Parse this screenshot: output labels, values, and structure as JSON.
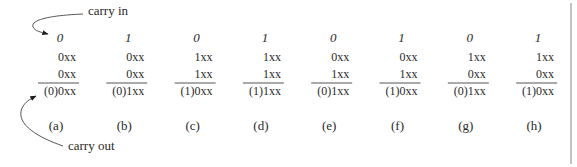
{
  "annotations": {
    "carry_in": "carry in",
    "carry_out": "carry out"
  },
  "columns": [
    {
      "label": "(a)",
      "carry_in": "0",
      "operand1": "0xx",
      "operand2": "0xx",
      "result": "(0)0xx"
    },
    {
      "label": "(b)",
      "carry_in": "1",
      "operand1": "0xx",
      "operand2": "0xx",
      "result": "(0)1xx"
    },
    {
      "label": "(c)",
      "carry_in": "0",
      "operand1": "1xx",
      "operand2": "1xx",
      "result": "(1)0xx"
    },
    {
      "label": "(d)",
      "carry_in": "1",
      "operand1": "1xx",
      "operand2": "1xx",
      "result": "(1)1xx"
    },
    {
      "label": "(e)",
      "carry_in": "0",
      "operand1": "0xx",
      "operand2": "1xx",
      "result": "(0)1xx"
    },
    {
      "label": "(f)",
      "carry_in": "1",
      "operand1": "0xx",
      "operand2": "1xx",
      "result": "(1)0xx"
    },
    {
      "label": "(g)",
      "carry_in": "0",
      "operand1": "1xx",
      "operand2": "0xx",
      "result": "(0)1xx"
    },
    {
      "label": "(h)",
      "carry_in": "1",
      "operand1": "1xx",
      "operand2": "0xx",
      "result": "(1)0xx"
    }
  ]
}
